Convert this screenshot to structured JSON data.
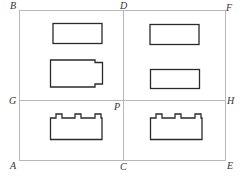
{
  "diagram": {
    "labels": {
      "B": "B",
      "D": "D",
      "F": "F",
      "G": "G",
      "P": "P",
      "H": "H",
      "A": "A",
      "C": "C",
      "E": "E"
    },
    "colors": {
      "grid_line": "#b8b8b8",
      "shape_stroke": "#2a2a2a",
      "label": "#333333"
    },
    "shapes": [
      {
        "region": "top-left",
        "type": "rectangle"
      },
      {
        "region": "middle-left",
        "type": "rectangle-with-notched-right-end"
      },
      {
        "region": "top-right",
        "type": "rectangle"
      },
      {
        "region": "middle-right",
        "type": "rectangle"
      },
      {
        "region": "bottom-left",
        "type": "rectangle-with-three-top-tabs"
      },
      {
        "region": "bottom-right",
        "type": "rectangle-with-three-top-tabs"
      }
    ]
  }
}
